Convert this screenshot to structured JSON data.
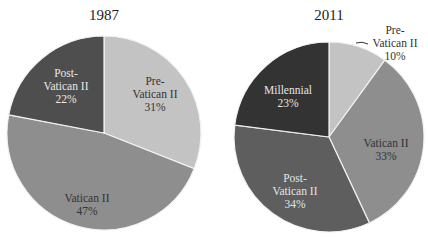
{
  "chart_data": [
    {
      "type": "pie",
      "title": "1987",
      "slices": [
        {
          "label": "Pre-Vatican II",
          "value": 31,
          "color": "#c3c3c3"
        },
        {
          "label": "Vatican II",
          "value": 47,
          "color": "#8e8e8e"
        },
        {
          "label": "Post-Vatican II",
          "value": 22,
          "color": "#4e4e4e"
        }
      ]
    },
    {
      "type": "pie",
      "title": "2011",
      "slices": [
        {
          "label": "Pre-Vatican II",
          "value": 10,
          "color": "#c3c3c3"
        },
        {
          "label": "Vatican II",
          "value": 33,
          "color": "#8e8e8e"
        },
        {
          "label": "Post-Vatican II",
          "value": 34,
          "color": "#5e5e5e"
        },
        {
          "label": "Millennial",
          "value": 23,
          "color": "#333333"
        }
      ]
    }
  ],
  "labels": {
    "left": {
      "pre": [
        "Pre-",
        "Vatican II",
        "31%"
      ],
      "vat": [
        "Vatican II",
        "47%"
      ],
      "post": [
        "Post-",
        "Vatican II",
        "22%"
      ]
    },
    "right": {
      "pre": [
        "Pre-",
        "Vatican II",
        "10%"
      ],
      "vat": [
        "Vatican II",
        "33%"
      ],
      "post": [
        "Post-",
        "Vatican II",
        "34%"
      ],
      "mill": [
        "Millennial",
        "23%"
      ]
    }
  }
}
